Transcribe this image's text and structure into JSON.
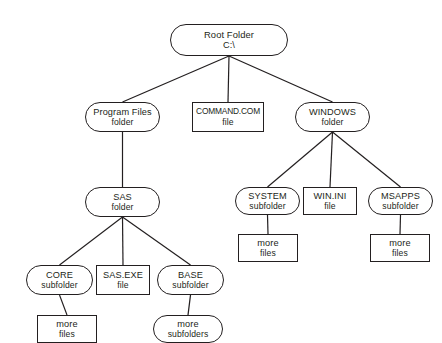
{
  "diagram": {
    "background_color": "#ffffff",
    "stroke_color": "#231f20",
    "shape_legend": {
      "folder": "rounded-stadium outline denotes a folder or subfolder",
      "file": "sharp rectangle outline denotes a file"
    },
    "nodes": [
      {
        "id": "root",
        "line1": "Root Folder",
        "line2": "C:\\",
        "shape": "folder",
        "x": 170,
        "y": 24,
        "w": 118,
        "h": 32
      },
      {
        "id": "program-files",
        "line1": "Program Files",
        "line2": "folder",
        "shape": "folder",
        "x": 85,
        "y": 102,
        "w": 75,
        "h": 30
      },
      {
        "id": "command-com",
        "line1": "COMMAND.COM",
        "line2": "file",
        "shape": "file",
        "x": 192,
        "y": 102,
        "w": 72,
        "h": 30
      },
      {
        "id": "windows",
        "line1": "WINDOWS",
        "line2": "folder",
        "shape": "folder",
        "x": 295,
        "y": 102,
        "w": 75,
        "h": 30
      },
      {
        "id": "sas",
        "line1": "SAS",
        "line2": "folder",
        "shape": "folder",
        "x": 85,
        "y": 187,
        "w": 75,
        "h": 30
      },
      {
        "id": "system",
        "line1": "SYSTEM",
        "line2": "subfolder",
        "shape": "folder",
        "x": 235,
        "y": 187,
        "w": 65,
        "h": 28
      },
      {
        "id": "win-ini",
        "line1": "WIN.INI",
        "line2": "file",
        "shape": "file",
        "x": 303,
        "y": 187,
        "w": 54,
        "h": 28
      },
      {
        "id": "msapps",
        "line1": "MSAPPS",
        "line2": "subfolder",
        "shape": "folder",
        "x": 368,
        "y": 187,
        "w": 65,
        "h": 28
      },
      {
        "id": "system-more-files",
        "line1": "more",
        "line2": "files",
        "shape": "file",
        "x": 238,
        "y": 234,
        "w": 60,
        "h": 28
      },
      {
        "id": "msapps-more-files",
        "line1": "more",
        "line2": "files",
        "shape": "file",
        "x": 370,
        "y": 234,
        "w": 60,
        "h": 28
      },
      {
        "id": "core",
        "line1": "CORE",
        "line2": "subfolder",
        "shape": "folder",
        "x": 26,
        "y": 265,
        "w": 67,
        "h": 30
      },
      {
        "id": "sas-exe",
        "line1": "SAS.EXE",
        "line2": "file",
        "shape": "file",
        "x": 96,
        "y": 265,
        "w": 54,
        "h": 30
      },
      {
        "id": "base",
        "line1": "BASE",
        "line2": "subfolder",
        "shape": "folder",
        "x": 157,
        "y": 265,
        "w": 67,
        "h": 30
      },
      {
        "id": "core-more-files",
        "line1": "more",
        "line2": "files",
        "shape": "file",
        "x": 37,
        "y": 315,
        "w": 60,
        "h": 28
      },
      {
        "id": "base-more-subfolders",
        "line1": "more",
        "line2": "subfolders",
        "shape": "folder",
        "x": 153,
        "y": 315,
        "w": 70,
        "h": 28
      }
    ],
    "edges": [
      {
        "from": "root",
        "to": "program-files"
      },
      {
        "from": "root",
        "to": "command-com"
      },
      {
        "from": "root",
        "to": "windows"
      },
      {
        "from": "program-files",
        "to": "sas"
      },
      {
        "from": "windows",
        "to": "system"
      },
      {
        "from": "windows",
        "to": "win-ini"
      },
      {
        "from": "windows",
        "to": "msapps"
      },
      {
        "from": "system",
        "to": "system-more-files"
      },
      {
        "from": "msapps",
        "to": "msapps-more-files"
      },
      {
        "from": "sas",
        "to": "core"
      },
      {
        "from": "sas",
        "to": "sas-exe"
      },
      {
        "from": "sas",
        "to": "base"
      },
      {
        "from": "core",
        "to": "core-more-files"
      },
      {
        "from": "base",
        "to": "base-more-subfolders"
      }
    ]
  }
}
